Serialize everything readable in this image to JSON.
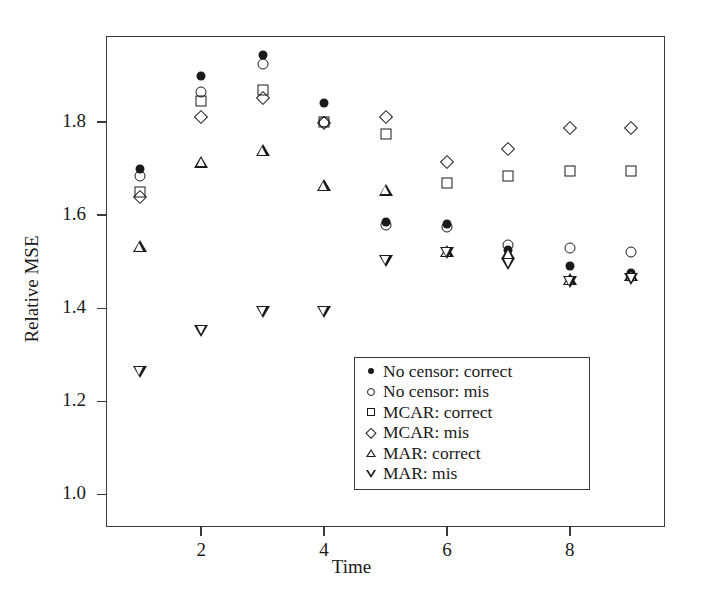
{
  "chart_data": {
    "type": "scatter",
    "title": "",
    "xlabel": "Time",
    "ylabel": "Relative MSE",
    "xlim": [
      0.45,
      9.55
    ],
    "ylim": [
      0.93,
      1.985
    ],
    "grid": false,
    "legend_position": "lower-center-right",
    "xticks": [
      2,
      4,
      6,
      8
    ],
    "xtick_labels": [
      "2",
      "4",
      "6",
      "8"
    ],
    "yticks": [
      1.0,
      1.2,
      1.4,
      1.6,
      1.8
    ],
    "ytick_labels": [
      "1.0",
      "1.2",
      "1.4",
      "1.6",
      "1.8"
    ],
    "x": [
      1,
      2,
      3,
      4,
      5,
      6,
      7,
      8,
      9
    ],
    "series": [
      {
        "name": "No censor: correct",
        "marker": "filled-circle",
        "values": [
          1.7,
          1.9,
          1.945,
          1.84,
          1.585,
          1.58,
          1.525,
          1.49,
          1.475
        ]
      },
      {
        "name": "No censor: mis",
        "marker": "open-circle",
        "values": [
          1.685,
          1.865,
          1.925,
          1.8,
          1.578,
          1.575,
          1.535,
          1.53,
          1.52
        ]
      },
      {
        "name": "MCAR: correct",
        "marker": "square",
        "values": [
          1.65,
          1.845,
          1.87,
          1.8,
          1.775,
          1.67,
          1.685,
          1.695,
          1.695
        ]
      },
      {
        "name": "MCAR: mis",
        "marker": "diamond",
        "values": [
          1.638,
          1.81,
          1.852,
          1.797,
          1.812,
          1.715,
          1.742,
          1.788,
          1.787
        ]
      },
      {
        "name": "MAR: correct",
        "marker": "triangle-up",
        "values": [
          1.533,
          1.715,
          1.74,
          1.665,
          1.655,
          1.522,
          1.518,
          1.462,
          1.472
        ]
      },
      {
        "name": "MAR: mis",
        "marker": "triangle-down",
        "values": [
          1.263,
          1.352,
          1.392,
          1.393,
          1.502,
          1.518,
          1.495,
          1.457,
          1.462
        ]
      }
    ]
  },
  "axes": {
    "ylabel": "Relative MSE",
    "xlabel": "Time"
  },
  "legend": {
    "entries": [
      {
        "label": "No censor: correct",
        "marker": "filled-circle"
      },
      {
        "label": "No censor: mis",
        "marker": "open-circle"
      },
      {
        "label": "MCAR: correct",
        "marker": "square"
      },
      {
        "label": "MCAR: mis",
        "marker": "diamond"
      },
      {
        "label": "MAR: correct",
        "marker": "triangle-up"
      },
      {
        "label": "MAR: mis",
        "marker": "triangle-down"
      }
    ]
  },
  "colors": {
    "marker": "#1a1a1a",
    "axis": "#3a3a3a",
    "background": "#ffffff"
  }
}
